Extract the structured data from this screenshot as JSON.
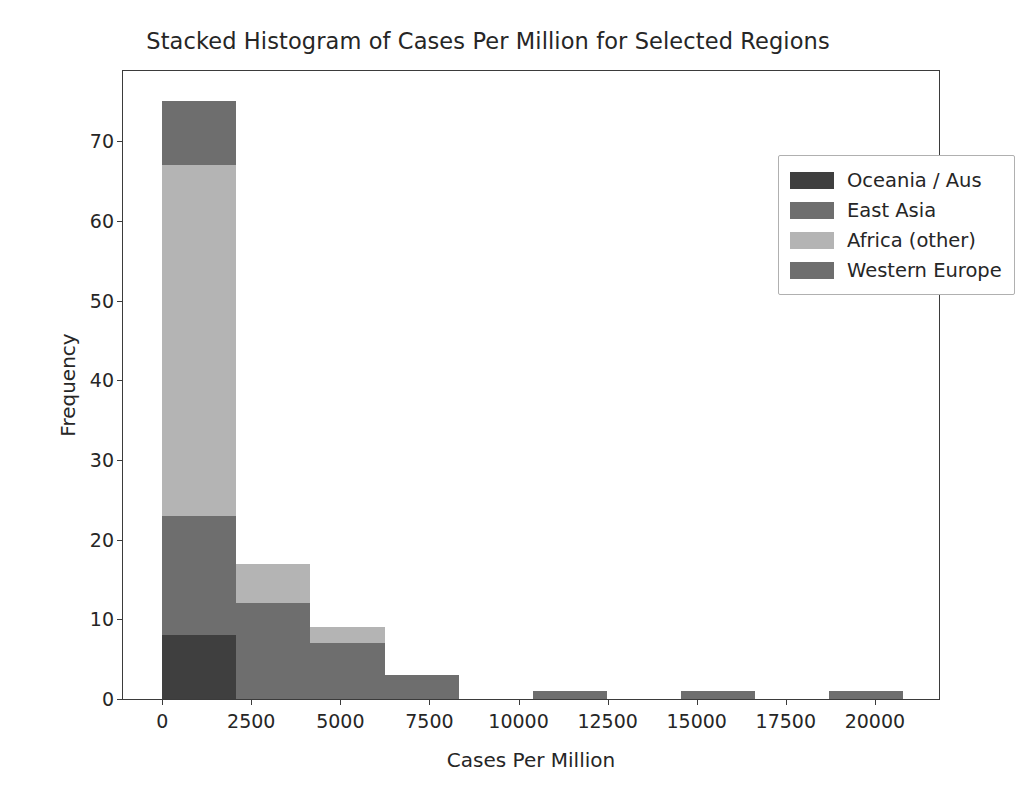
{
  "chart_data": {
    "type": "bar",
    "title": "Stacked Histogram of Cases Per Million for Selected Regions",
    "xlabel": "Cases Per Million",
    "ylabel": "Frequency",
    "stacked": true,
    "grid": false,
    "legend_position": "upper right",
    "xlim": [
      -1100,
      21800
    ],
    "ylim": [
      0,
      78.8
    ],
    "xticks": [
      0,
      2500,
      5000,
      7500,
      10000,
      12500,
      15000,
      17500,
      20000
    ],
    "xtick_labels": [
      "0",
      "2500",
      "5000",
      "7500",
      "10000",
      "12500",
      "15000",
      "17500",
      "20000"
    ],
    "yticks": [
      0,
      10,
      20,
      30,
      40,
      50,
      60,
      70
    ],
    "ytick_labels": [
      "0",
      "10",
      "20",
      "30",
      "40",
      "50",
      "60",
      "70"
    ],
    "bin_edges": [
      0,
      2080,
      4160,
      6240,
      8320,
      10400,
      12480,
      14560,
      16640,
      18720,
      20800
    ],
    "bin_width": 2080,
    "series": [
      {
        "name": "Oceania / Aus",
        "color": "#3f3f3f",
        "values": [
          8,
          0,
          0,
          0,
          0,
          0,
          0,
          0,
          0,
          0
        ]
      },
      {
        "name": "East Asia",
        "color": "#6e6e6e",
        "values": [
          8,
          0,
          0,
          0,
          0,
          0,
          0,
          0,
          0,
          0
        ]
      },
      {
        "name": "Africa (other)",
        "color": "#b4b4b4",
        "values": [
          44,
          5,
          2,
          0,
          0,
          0,
          0,
          0,
          0,
          0
        ]
      },
      {
        "name": "Western Europe",
        "color": "#6e6e6e",
        "values": [
          15,
          12,
          7,
          3,
          0,
          1,
          0,
          1,
          0,
          1
        ]
      }
    ],
    "stack_order_bottom_to_top": [
      "Oceania / Aus",
      "Western Europe",
      "Africa (other)",
      "East Asia"
    ],
    "bar_totals": [
      75,
      17,
      9,
      3,
      0,
      1,
      0,
      1,
      0,
      1
    ]
  },
  "legend": {
    "entries": [
      {
        "label": "Oceania / Aus",
        "color": "#3f3f3f"
      },
      {
        "label": "East Asia",
        "color": "#6e6e6e"
      },
      {
        "label": "Africa (other)",
        "color": "#b4b4b4"
      },
      {
        "label": "Western Europe",
        "color": "#6e6e6e"
      }
    ]
  },
  "axes": {
    "frame_color": "#3b3b3b",
    "background": "#ffffff"
  }
}
